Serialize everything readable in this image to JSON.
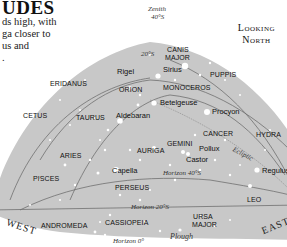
{
  "header": {
    "title_fragment": "UDES",
    "intro_lines": [
      "ds high, with",
      "ga closer to",
      "us and",
      "."
    ],
    "looking_line1": "Looking",
    "looking_line2": "North"
  },
  "colors": {
    "sky": "#c9c9c9",
    "sky_edge": "#bdbdbd",
    "line": "#6f6f6f",
    "star": "#ffffff",
    "text": "#111111"
  },
  "zenith": {
    "label": "Zenith",
    "value": "40°S"
  },
  "horizons": {
    "h20": "20°S",
    "h40": "Horizon 40°S",
    "h20b": "Horizon 20°S",
    "h0": "Horizon 0°"
  },
  "ecliptic_label": "Ecliptic",
  "directions": {
    "west": "WEST",
    "east": "EAST"
  },
  "constellations": {
    "canis_major_1": "CANIS",
    "canis_major_2": "MAJOR",
    "puppis": "PUPPIS",
    "eridanus": "ERIDANUS",
    "orion": "ORION",
    "monoceros": "MONOCEROS",
    "cetus": "CETUS",
    "taurus": "TAURUS",
    "cancer": "CANCER",
    "hydra": "HYDRA",
    "gemini": "GEMINI",
    "auriga": "AURIGA",
    "aries": "ARIES",
    "pisces": "PISCES",
    "perseus": "PERSEUS",
    "leo": "LEO",
    "andromeda": "ANDROMEDA",
    "cassiopeia": "CASSIOPEIA",
    "ursa_major_1": "URSA",
    "ursa_major_2": "MAJOR"
  },
  "stars": {
    "rigel": "Rigel",
    "sirius": "Sirius",
    "betelgeuse": "Betelgeuse",
    "procyon": "Procyon",
    "aldebaran": "Aldebaran",
    "pollux": "Pollux",
    "castor": "Castor",
    "capella": "Capella",
    "regulus": "Regulus"
  },
  "asterisms": {
    "plough": "Plough"
  }
}
